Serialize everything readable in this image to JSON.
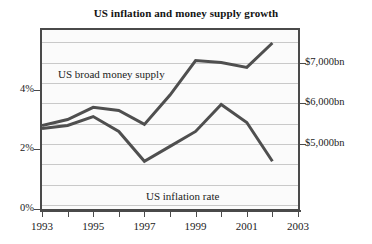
{
  "chart_data": {
    "type": "line",
    "title": "US inflation and money supply growth",
    "xlabel": "",
    "ylabel_left": "",
    "ylabel_right": "",
    "x": [
      1993,
      1994,
      1995,
      1996,
      1997,
      1998,
      1999,
      2000,
      2001,
      2002
    ],
    "xlim": [
      1993,
      2003
    ],
    "x_tick_labels": [
      "1993",
      "1995",
      "1997",
      "1999",
      "2001",
      "2003"
    ],
    "x_tick_values": [
      1993,
      1995,
      1997,
      1999,
      2001,
      2003
    ],
    "x_minor_tick_values": [
      1994,
      1996,
      1998,
      2000,
      2002
    ],
    "grid": true,
    "legend_position": "inline-annotations",
    "left_axis": {
      "unit": "percent",
      "tick_labels": [
        "0%",
        "2%",
        "4%"
      ],
      "tick_values": [
        0,
        2,
        4
      ],
      "ylim": [
        0,
        6
      ]
    },
    "right_axis": {
      "unit": "billions of US dollars",
      "tick_labels": [
        "$5,000bn",
        "$6,000bn",
        "$7,000bn"
      ],
      "tick_values": [
        5000,
        6000,
        7000
      ],
      "ylim": [
        3400,
        7800
      ]
    },
    "series": [
      {
        "name": "US broad money supply",
        "axis": "right",
        "unit": "bn",
        "values": [
          5450,
          5600,
          5900,
          5820,
          5480,
          6200,
          7050,
          7000,
          6880,
          7480
        ]
      },
      {
        "name": "US inflation rate",
        "axis": "left",
        "unit": "%",
        "values": [
          2.7,
          2.8,
          3.1,
          2.6,
          1.6,
          2.1,
          2.6,
          3.5,
          2.9,
          1.6
        ]
      }
    ],
    "annotations": [
      {
        "text": "US broad money supply",
        "series": "US broad money supply"
      },
      {
        "text": "US inflation rate",
        "series": "US inflation rate"
      }
    ],
    "colors": {
      "line": "#4f4f4f",
      "frame": "#4a4a4a",
      "grid": "#c9c9c9",
      "plot_background": "#fbfbfb",
      "text": "#1b1b1b"
    }
  }
}
